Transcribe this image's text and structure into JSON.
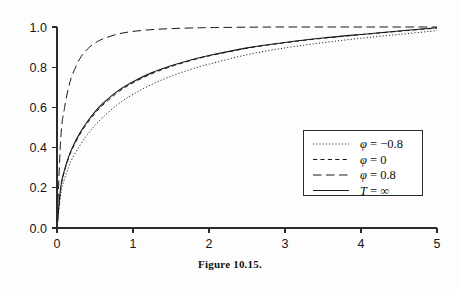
{
  "figure": {
    "caption": "Figure 10.15."
  },
  "chart_data": {
    "type": "line",
    "title": "",
    "xlabel": "",
    "ylabel": "",
    "xlim": [
      0,
      5
    ],
    "ylim": [
      0.0,
      1.0
    ],
    "grid": false,
    "legend_position": "lower-right",
    "xticks": [
      "0",
      "1",
      "2",
      "3",
      "4",
      "5"
    ],
    "xtick_values": [
      0,
      1,
      2,
      3,
      4,
      5
    ],
    "yticks": [
      "0.0",
      "0.2",
      "0.4",
      "0.6",
      "0.8",
      "1.0"
    ],
    "ytick_values": [
      0.0,
      0.2,
      0.4,
      0.6,
      0.8,
      1.0
    ],
    "x": [
      0,
      0.05,
      0.1,
      0.15,
      0.2,
      0.3,
      0.4,
      0.5,
      0.6,
      0.8,
      1.0,
      1.25,
      1.5,
      1.75,
      2.0,
      2.5,
      3.0,
      3.5,
      4.0,
      4.5,
      5.0
    ],
    "series": [
      {
        "name": "phi = -0.8",
        "label": "φ = −0.8",
        "style": "dotted",
        "values": [
          0.0,
          0.17,
          0.245,
          0.3,
          0.345,
          0.41,
          0.465,
          0.51,
          0.55,
          0.615,
          0.665,
          0.715,
          0.755,
          0.788,
          0.815,
          0.862,
          0.896,
          0.922,
          0.944,
          0.963,
          0.982
        ]
      },
      {
        "name": "phi = 0",
        "label": "φ = 0",
        "style": "dashed",
        "values": [
          0.0,
          0.2,
          0.285,
          0.345,
          0.392,
          0.465,
          0.522,
          0.57,
          0.61,
          0.675,
          0.722,
          0.768,
          0.803,
          0.832,
          0.856,
          0.894,
          0.922,
          0.944,
          0.962,
          0.979,
          0.995
        ]
      },
      {
        "name": "phi = 0.8",
        "label": "φ = 0.8",
        "style": "longdash",
        "values": [
          0.0,
          0.45,
          0.6,
          0.695,
          0.76,
          0.842,
          0.89,
          0.92,
          0.94,
          0.965,
          0.978,
          0.987,
          0.992,
          0.995,
          0.997,
          0.999,
          1.0,
          1.0,
          1.0,
          1.0,
          1.0
        ]
      },
      {
        "name": "T = infinity",
        "label": "T = ∞",
        "style": "solid",
        "values": [
          0.0,
          0.205,
          0.29,
          0.35,
          0.398,
          0.472,
          0.53,
          0.578,
          0.618,
          0.682,
          0.728,
          0.773,
          0.807,
          0.835,
          0.858,
          0.896,
          0.923,
          0.945,
          0.963,
          0.98,
          0.996
        ]
      }
    ]
  }
}
